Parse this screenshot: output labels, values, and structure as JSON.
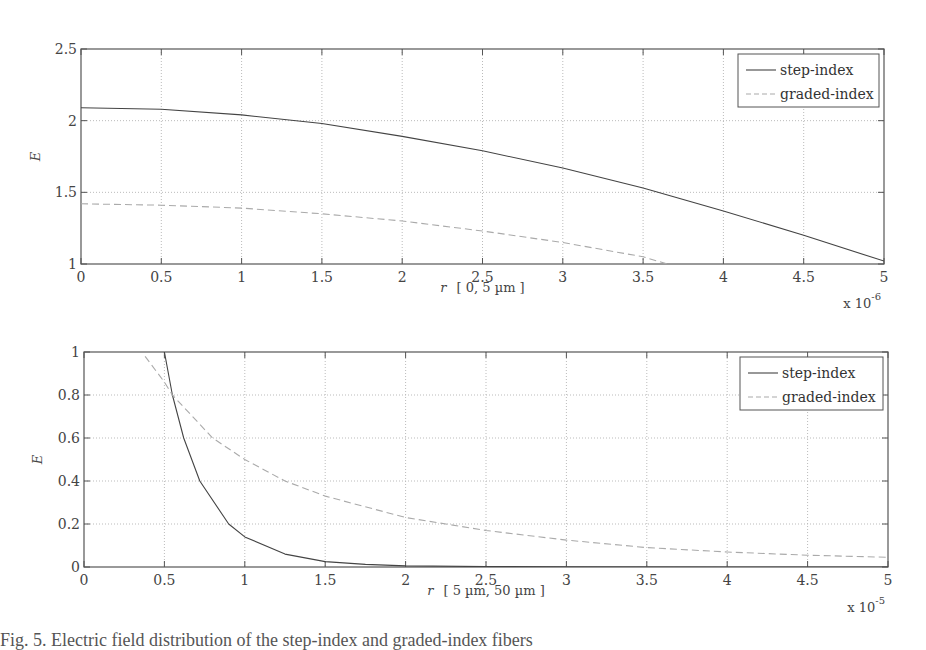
{
  "chart_data": [
    {
      "type": "line",
      "title": "",
      "xlabel": "r  [ 0, 5 µm ]",
      "ylabel": "E",
      "x_multiplier": "x 10^-6",
      "xlim": [
        0,
        5
      ],
      "ylim": [
        1,
        2.5
      ],
      "xticks": [
        "0",
        "0.5",
        "1",
        "1.5",
        "2",
        "2.5",
        "3",
        "3.5",
        "4",
        "4.5",
        "5"
      ],
      "yticks": [
        "1",
        "1.5",
        "2",
        "2.5"
      ],
      "grid": true,
      "legend_position": "top-right",
      "series": [
        {
          "name": "step-index",
          "style": "solid",
          "x": [
            0,
            0.5,
            1,
            1.5,
            2,
            2.5,
            3,
            3.5,
            4,
            4.5,
            5
          ],
          "values": [
            2.09,
            2.08,
            2.04,
            1.98,
            1.89,
            1.79,
            1.67,
            1.53,
            1.37,
            1.2,
            1.02
          ]
        },
        {
          "name": "graded-index",
          "style": "dashed",
          "x": [
            0,
            0.5,
            1,
            1.5,
            2,
            2.5,
            3,
            3.5,
            3.65
          ],
          "values": [
            1.42,
            1.41,
            1.39,
            1.35,
            1.3,
            1.23,
            1.15,
            1.05,
            1.0
          ]
        }
      ]
    },
    {
      "type": "line",
      "title": "",
      "xlabel": "r  [ 5 µm, 50 µm ]",
      "ylabel": "E",
      "x_multiplier": "x 10^-5",
      "xlim": [
        0,
        5
      ],
      "ylim": [
        0,
        1
      ],
      "xticks": [
        "0",
        "0.5",
        "1",
        "1.5",
        "2",
        "2.5",
        "3",
        "3.5",
        "4",
        "4.5",
        "5"
      ],
      "yticks": [
        "0",
        "0.2",
        "0.4",
        "0.6",
        "0.8",
        "1"
      ],
      "grid": true,
      "legend_position": "top-right",
      "series": [
        {
          "name": "step-index",
          "style": "solid",
          "x": [
            0.5,
            0.55,
            0.62,
            0.72,
            0.9,
            1,
            1.25,
            1.5,
            1.75,
            2,
            2.5,
            3,
            4,
            5
          ],
          "values": [
            1.0,
            0.8,
            0.6,
            0.4,
            0.2,
            0.14,
            0.06,
            0.025,
            0.012,
            0.005,
            0.002,
            0.001,
            0,
            0
          ]
        },
        {
          "name": "graded-index",
          "style": "dashed",
          "x": [
            0.38,
            0.5,
            0.55,
            0.8,
            1,
            1.25,
            1.5,
            2,
            2.5,
            3,
            3.5,
            4,
            4.5,
            5
          ],
          "values": [
            0.98,
            0.86,
            0.8,
            0.6,
            0.5,
            0.4,
            0.33,
            0.23,
            0.17,
            0.125,
            0.09,
            0.07,
            0.055,
            0.045
          ]
        }
      ]
    }
  ],
  "plots": [
    {
      "ylabel": "E",
      "xlabel_var": "r",
      "xlabel_range": "[ 0, 5 µm ]",
      "exp_base": "x 10",
      "exp_power": "-6",
      "legend": [
        "step-index",
        "graded-index"
      ]
    },
    {
      "ylabel": "E",
      "xlabel_var": "r",
      "xlabel_range": "[ 5 µm, 50 µm ]",
      "exp_base": "x 10",
      "exp_power": "-5",
      "legend": [
        "step-index",
        "graded-index"
      ]
    }
  ],
  "caption": "Fig. 5. Electric field distribution of the step-index and graded-index fibers"
}
